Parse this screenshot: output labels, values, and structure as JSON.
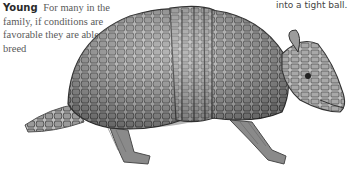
{
  "caption_left": {
    "lead": "Young",
    "text": "For many in the family, if conditions are favorable they are able to breed"
  },
  "caption_right": {
    "text": "into a tight ball."
  },
  "illustration": {
    "subject": "armadillo",
    "style": "grayscale pencil illustration"
  }
}
